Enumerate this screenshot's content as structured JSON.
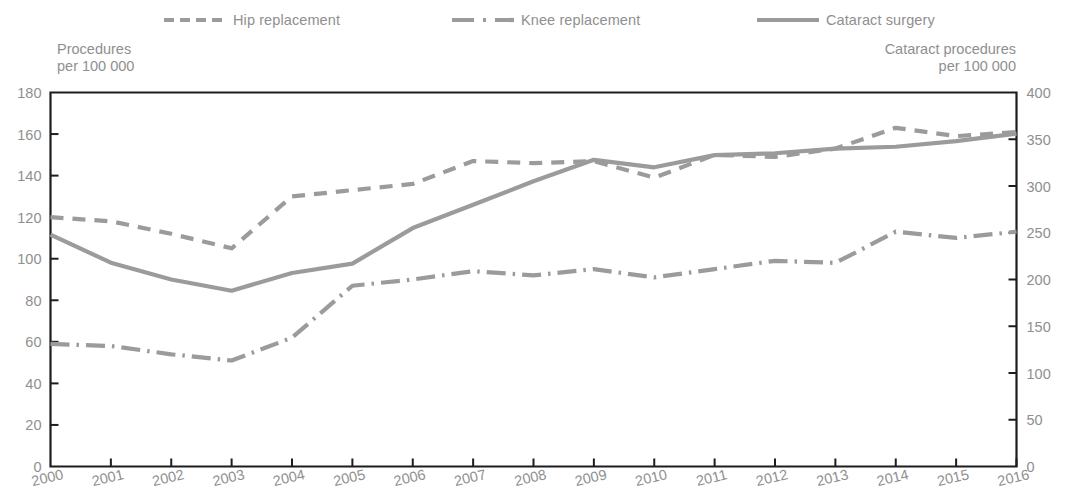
{
  "legend": {
    "items": [
      {
        "id": "hip",
        "label": "Hip replacement",
        "style": "dashed",
        "color": "#9b9b9b"
      },
      {
        "id": "knee",
        "label": "Knee replacement",
        "style": "dash-dot",
        "color": "#9b9b9b"
      },
      {
        "id": "cataract",
        "label": "Cataract surgery",
        "style": "solid",
        "color": "#9b9b9b"
      }
    ]
  },
  "axis_titles": {
    "left": "Procedures\nper 100 000",
    "right": "Cataract procedures\nper 100 000"
  },
  "chart_data": {
    "type": "line",
    "title": "",
    "subtitle": "",
    "xlabel": "",
    "ylabel": "Procedures per 100 000",
    "y2label": "Cataract procedures per 100 000",
    "grid": false,
    "legend_position": "top",
    "x": [
      2000,
      2001,
      2002,
      2003,
      2004,
      2005,
      2006,
      2007,
      2008,
      2009,
      2010,
      2011,
      2012,
      2013,
      2014,
      2015,
      2016
    ],
    "categories": [
      "2000",
      "2001",
      "2002",
      "2003",
      "2004",
      "2005",
      "2006",
      "2007",
      "2008",
      "2009",
      "2010",
      "2011",
      "2012",
      "2013",
      "2014",
      "2015",
      "2016"
    ],
    "ylim": [
      0,
      180
    ],
    "yticks": [
      0,
      20,
      40,
      60,
      80,
      100,
      120,
      140,
      160,
      180
    ],
    "y2lim": [
      0,
      400
    ],
    "y2ticks": [
      0,
      50,
      100,
      150,
      200,
      250,
      300,
      350,
      400
    ],
    "series": [
      {
        "name": "Hip replacement",
        "axis": "left",
        "style": "dashed",
        "color": "#9b9b9b",
        "values": [
          120,
          118,
          112,
          105,
          130,
          133,
          136,
          147,
          146,
          147,
          139,
          150,
          149,
          153,
          163,
          159,
          161
        ]
      },
      {
        "name": "Knee replacement",
        "axis": "left",
        "style": "dash-dot",
        "color": "#9b9b9b",
        "values": [
          59,
          58,
          54,
          51,
          62,
          87,
          90,
          94,
          92,
          95,
          91,
          95,
          99,
          98,
          113,
          110,
          113
        ]
      },
      {
        "name": "Cataract surgery",
        "axis": "right",
        "style": "solid",
        "color": "#9b9b9b",
        "values": [
          248,
          218,
          200,
          188,
          207,
          217,
          255,
          280,
          305,
          328,
          320,
          333,
          335,
          340,
          342,
          348,
          356
        ]
      }
    ]
  }
}
